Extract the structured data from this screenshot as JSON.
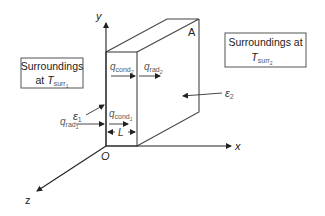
{
  "diagram": {
    "type": "plane-wall-radiation-conduction",
    "axes": {
      "x_label": "x",
      "y_label": "y",
      "z_label": "z",
      "origin_label": "O"
    },
    "corner_label": "A",
    "left_surroundings": {
      "line1": "Surroundings",
      "line2_prefix": "at ",
      "T_symbol": "T",
      "T_subscript": "surr",
      "T_sub_index": "1"
    },
    "right_surroundings": {
      "line1": "Surroundings at",
      "T_symbol": "T",
      "T_subscript": "surr",
      "T_sub_index": "2"
    },
    "heat_flows": {
      "q_cond_2": {
        "symbol": "q",
        "sub": "cond",
        "index": "2"
      },
      "q_rad_2": {
        "symbol": "q",
        "sub": "rad",
        "index": "2"
      },
      "q_cond_1": {
        "symbol": "q",
        "sub": "cond",
        "index": "1"
      },
      "q_rad_1": {
        "symbol": "q",
        "sub": "rad",
        "index": "1"
      }
    },
    "emissivities": {
      "eps1": {
        "symbol": "ε",
        "index": "1"
      },
      "eps2": {
        "symbol": "ε",
        "index": "2"
      }
    },
    "thickness_label": "L",
    "colors": {
      "line": "#333333",
      "text": "#222222",
      "label_gray": "#555555",
      "box_border": "#555555"
    }
  }
}
